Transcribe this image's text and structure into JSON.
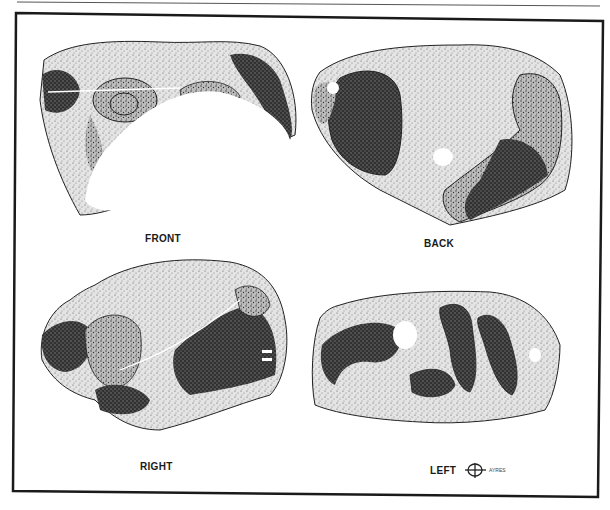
{
  "figure": {
    "views": [
      {
        "id": "front",
        "label": "FRONT"
      },
      {
        "id": "back",
        "label": "BACK"
      },
      {
        "id": "right",
        "label": "RIGHT"
      },
      {
        "id": "left",
        "label": "LEFT"
      }
    ],
    "signature": {
      "initials": "AYR",
      "text": "AYRES"
    },
    "colors": {
      "ink": "#1a1a1a",
      "stipple_mid": "#8a8a8a",
      "stipple_light": "#c8c8c8",
      "stipple_dark": "#3a3a3a",
      "paper": "#ffffff"
    }
  }
}
